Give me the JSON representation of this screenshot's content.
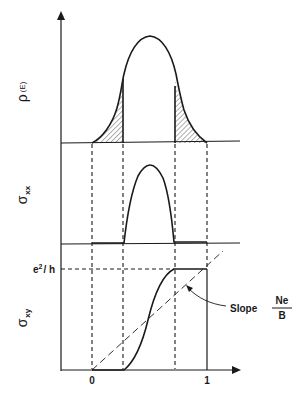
{
  "figure": {
    "panels": [
      {
        "id": "density_of_states",
        "ylabel_main": "ρ",
        "ylabel_sub": "(E)",
        "description": "Bell-shaped density of states with hatched tails (localized states)"
      },
      {
        "id": "sigma_xx",
        "ylabel_main": "σ",
        "ylabel_sub": "xx",
        "description": "Longitudinal conductivity nonzero only between mobility edges"
      },
      {
        "id": "sigma_xy",
        "ylabel_main": "σ",
        "ylabel_sub": "xy",
        "description": "Hall conductivity step rising from 0 to e²/h with plateaus"
      }
    ],
    "x_axis": {
      "ticks": [
        {
          "value": "0",
          "x": 92
        },
        {
          "value": "1",
          "x": 207
        }
      ]
    },
    "plateau_label": {
      "base": "e",
      "sup": "2",
      "suffix": "/ h"
    },
    "slope_annotation": {
      "label": "Slope",
      "numerator": "Ne",
      "denominator": "B"
    }
  }
}
